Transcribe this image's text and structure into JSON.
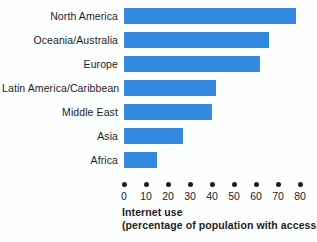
{
  "chart_data": {
    "type": "bar",
    "orientation": "horizontal",
    "title": "",
    "xlabel_line1": "Internet use",
    "xlabel_line2": "(percentage of population with access)",
    "ylabel": "",
    "categories": [
      "North America",
      "Oceania/Australia",
      "Europe",
      "Latin America/Caribbean",
      "Middle East",
      "Asia",
      "Africa"
    ],
    "values": [
      78,
      66,
      62,
      42,
      40,
      27,
      15
    ],
    "xlim": [
      0,
      80
    ],
    "xticks": [
      0,
      10,
      20,
      30,
      40,
      50,
      60,
      70,
      80
    ],
    "xtick_labels": [
      "0",
      "10",
      "20",
      "30",
      "40",
      "50",
      "60",
      "70",
      "80"
    ],
    "grid": false,
    "legend": false,
    "bar_color": "#3289de",
    "text_color": "#1d1d1b",
    "background": "#fdfefe",
    "tick_marker": "filled-dot"
  }
}
